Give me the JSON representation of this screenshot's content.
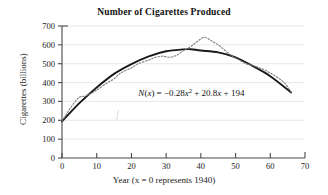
{
  "chart_data": {
    "type": "line",
    "title": "Number of Cigarettes Produced",
    "xlabel": "Year (x = 0 represents 1940)",
    "ylabel": "Cigarettes (billions)",
    "xlim": [
      0,
      70
    ],
    "ylim": [
      0,
      700
    ],
    "xticks": [
      0,
      10,
      20,
      30,
      40,
      50,
      60,
      70
    ],
    "yticks": [
      0,
      100,
      200,
      300,
      400,
      500,
      600,
      700
    ],
    "grid": "horizontal",
    "legend": "none",
    "annotations": [
      {
        "name": "regression-equation",
        "text": "N(x) = −0.28x² + 20.8x + 194",
        "x": 22,
        "y": 330
      }
    ],
    "series": [
      {
        "name": "Quadratic model N(x) = -0.28x^2 + 20.8x + 194",
        "style": "solid",
        "color": "#1a1a1a",
        "x": [
          0,
          5,
          10,
          15,
          20,
          25,
          30,
          35,
          37.1,
          40,
          45,
          50,
          55,
          60,
          66
        ],
        "values": [
          194,
          291,
          374,
          446,
          498,
          539,
          566,
          576,
          577,
          570,
          560,
          534,
          487,
          434,
          348
        ]
      },
      {
        "name": "Actual data",
        "style": "dotted",
        "color": "#808080",
        "x": [
          0,
          3,
          5,
          7,
          10,
          13,
          15,
          17,
          20,
          22,
          25,
          27,
          29,
          31,
          33,
          35,
          37,
          39,
          41,
          43,
          45,
          47,
          49,
          51,
          53,
          55,
          58,
          61,
          64,
          66
        ],
        "values": [
          196,
          280,
          322,
          330,
          360,
          398,
          420,
          452,
          478,
          500,
          520,
          534,
          540,
          534,
          545,
          570,
          590,
          618,
          640,
          622,
          600,
          570,
          540,
          520,
          500,
          490,
          470,
          440,
          400,
          350
        ]
      }
    ]
  },
  "figure": {
    "background_color": "#ffffff",
    "axis_color": "#4a4a4a",
    "grid_color": "#e2e2e2"
  }
}
